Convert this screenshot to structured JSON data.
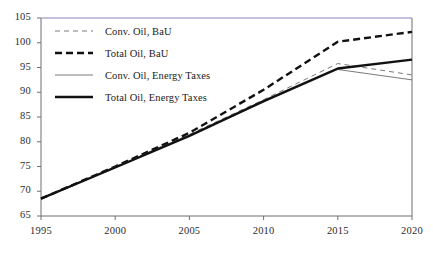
{
  "chart_data": {
    "type": "line",
    "title": "",
    "xlabel": "",
    "ylabel": "",
    "x": [
      1995,
      2000,
      2005,
      2010,
      2015,
      2020
    ],
    "xlim": [
      1995,
      2020
    ],
    "ylim": [
      65,
      105
    ],
    "xticks": [
      "1995",
      "2000",
      "2005",
      "2010",
      "2015",
      "2020"
    ],
    "yticks": [
      "65",
      "70",
      "75",
      "80",
      "85",
      "90",
      "95",
      "100",
      "105"
    ],
    "grid": false,
    "legend_position": "upper-left",
    "series": [
      {
        "name": "Conv. Oil, BaU",
        "style": "dashed",
        "width": "thin",
        "color": "#6b6b6b",
        "values": [
          68.5,
          75.0,
          81.5,
          88.5,
          95.8,
          93.5
        ]
      },
      {
        "name": "Total Oil, BaU",
        "style": "dashed",
        "width": "thick",
        "color": "#111111",
        "values": [
          68.5,
          75.0,
          81.8,
          90.5,
          100.2,
          102.2
        ]
      },
      {
        "name": "Conv. Oil, Energy Taxes",
        "style": "solid",
        "width": "thin",
        "color": "#6b6b6b",
        "values": [
          68.5,
          74.9,
          81.3,
          88.0,
          94.6,
          92.5
        ]
      },
      {
        "name": "Total Oil, Energy Taxes",
        "style": "solid",
        "width": "thick",
        "color": "#111111",
        "values": [
          68.5,
          74.8,
          81.2,
          88.2,
          94.8,
          96.6
        ]
      }
    ]
  },
  "axis": {
    "top_accent_color": "#9a8ec9",
    "line_color": "#6f6f6f"
  }
}
